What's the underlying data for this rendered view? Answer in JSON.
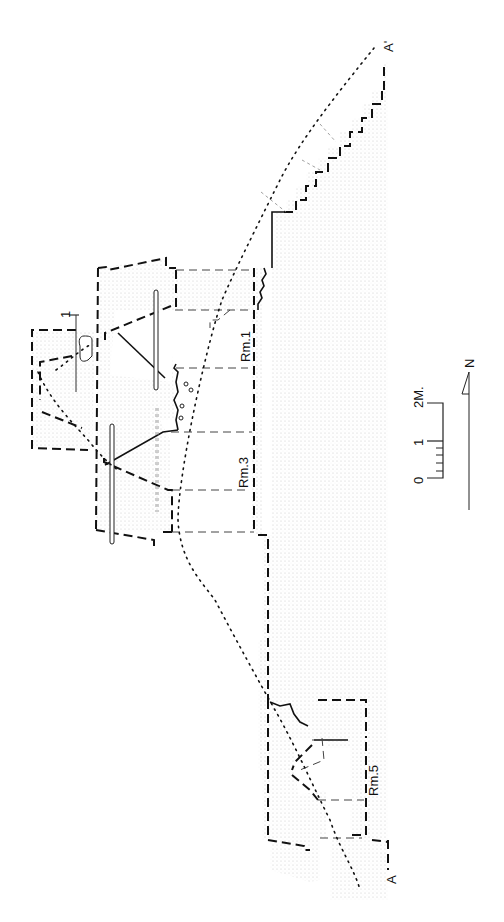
{
  "figure": {
    "type": "archaeological section drawing",
    "orientation": "rotated 90° (north to the right)",
    "section_line": {
      "start_label": "A",
      "end_label": "A'"
    },
    "rooms": [
      {
        "label": "Rm.1"
      },
      {
        "label": "Rm.3"
      },
      {
        "label": "Rm.5"
      }
    ],
    "marker_label": "1",
    "scale_bar": {
      "ticks": [
        "0",
        "1",
        "2M."
      ],
      "unit": "meters",
      "length_m": 2,
      "minor_divisions_first_meter": 5
    },
    "north_arrow": {
      "label": "N"
    },
    "line_legend": {
      "heavy_dashed": "reconstructed wall outline",
      "solid": "preserved wall / bedrock profile",
      "light_dashed": "floor / room division",
      "dotted": "ground surface profile"
    },
    "colors": {
      "ink": "#111111",
      "stipple": "#c8c8c8",
      "background": "#ffffff"
    }
  }
}
